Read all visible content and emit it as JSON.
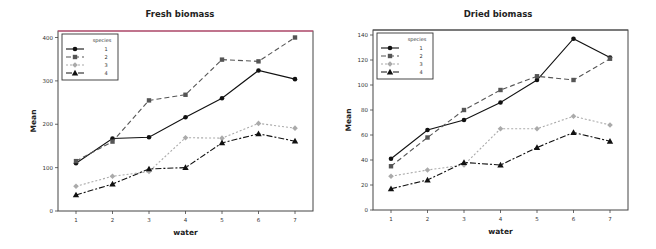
{
  "chart_data": [
    {
      "type": "line",
      "title": "Fresh biomass",
      "xlabel": "water",
      "ylabel": "Mean",
      "x": [
        1,
        2,
        3,
        4,
        5,
        6,
        7
      ],
      "yticks": [
        0,
        100,
        200,
        300,
        400
      ],
      "ylim": [
        0,
        415
      ],
      "legend": {
        "title": "species",
        "position": "top-left"
      },
      "frame_top_color": "#e0487a",
      "series": [
        {
          "name": "1",
          "marker": "circle",
          "line": "solid",
          "color": "#111111",
          "values": [
            110,
            167,
            170,
            216,
            260,
            324,
            304
          ]
        },
        {
          "name": "2",
          "marker": "square",
          "line": "dashed",
          "color": "#555555",
          "values": [
            115,
            160,
            255,
            268,
            349,
            345,
            400
          ]
        },
        {
          "name": "3",
          "marker": "diamond",
          "line": "dotted",
          "color": "#aaaaaa",
          "values": [
            57,
            80,
            91,
            169,
            168,
            202,
            191
          ]
        },
        {
          "name": "4",
          "marker": "triangle",
          "line": "dashdot",
          "color": "#111111",
          "values": [
            37,
            62,
            97,
            100,
            157,
            178,
            161
          ]
        }
      ]
    },
    {
      "type": "line",
      "title": "Dried biomass",
      "xlabel": "water",
      "ylabel": "Mean",
      "x": [
        1,
        2,
        3,
        4,
        5,
        6,
        7
      ],
      "yticks": [
        0,
        20,
        40,
        60,
        80,
        100,
        120,
        140
      ],
      "ylim": [
        0,
        144
      ],
      "legend": {
        "title": "species",
        "position": "top-left"
      },
      "frame_top_color": "#555555",
      "series": [
        {
          "name": "1",
          "marker": "circle",
          "line": "solid",
          "color": "#111111",
          "values": [
            41,
            64,
            72,
            86,
            104,
            137,
            122
          ]
        },
        {
          "name": "2",
          "marker": "square",
          "line": "dashed",
          "color": "#555555",
          "values": [
            35,
            58,
            80,
            96,
            107,
            104,
            121
          ]
        },
        {
          "name": "3",
          "marker": "diamond",
          "line": "dotted",
          "color": "#aaaaaa",
          "values": [
            27,
            32,
            36,
            65,
            65,
            75,
            68
          ]
        },
        {
          "name": "4",
          "marker": "triangle",
          "line": "dashdot",
          "color": "#111111",
          "values": [
            17,
            24,
            38,
            36,
            50,
            62,
            55
          ]
        }
      ]
    }
  ]
}
